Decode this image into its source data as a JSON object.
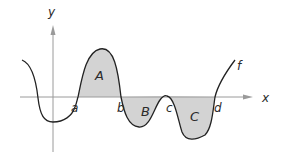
{
  "diagram": {
    "axes": {
      "x_label": "x",
      "y_label": "y"
    },
    "function_label": "f",
    "regions": [
      {
        "label": "A",
        "sign": "positive",
        "from": "a",
        "to": "b"
      },
      {
        "label": "B",
        "sign": "negative",
        "from": "b",
        "to": "c"
      },
      {
        "label": "C",
        "sign": "negative",
        "from": "c",
        "to": "d"
      }
    ],
    "points": [
      {
        "label": "a"
      },
      {
        "label": "b"
      },
      {
        "label": "c"
      },
      {
        "label": "d"
      }
    ],
    "colors": {
      "axis": "#9a9a9a",
      "curve": "#222222",
      "fill": "#d3d3d3",
      "text": "#2a2a2a"
    }
  }
}
